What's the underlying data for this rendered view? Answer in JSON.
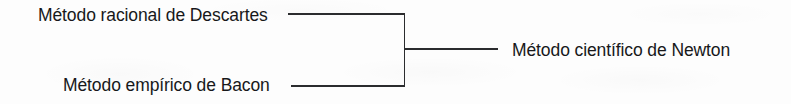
{
  "diagram": {
    "type": "brace-convergence",
    "orientation": "left-inputs-to-right-output",
    "inputs": [
      {
        "id": "descartes",
        "label": "Método racional de Descartes"
      },
      {
        "id": "bacon",
        "label": "Método empírico de Bacon"
      }
    ],
    "output": {
      "id": "newton",
      "label": "Método científico de Newton"
    },
    "connectors": {
      "top_arm": "horizontal-line",
      "bottom_arm": "horizontal-line",
      "spine": "vertical-line",
      "stem": "horizontal-line"
    },
    "colors": {
      "background": "#fdfdfd",
      "text": "#17181a",
      "line": "#2b2c2e"
    }
  }
}
